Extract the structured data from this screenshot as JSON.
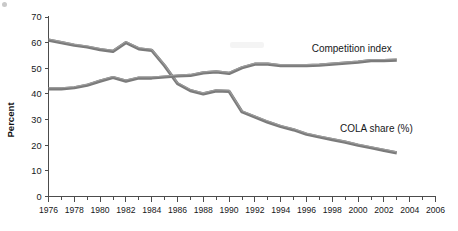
{
  "chart_data": {
    "type": "line",
    "title": "",
    "xlabel": "",
    "ylabel": "Percent",
    "xlim": [
      1976,
      2006
    ],
    "ylim": [
      0,
      70
    ],
    "ytick_step": 10,
    "yticks": [
      0,
      10,
      20,
      30,
      40,
      50,
      60,
      70
    ],
    "xticks": [
      1976,
      1978,
      1980,
      1982,
      1984,
      1986,
      1988,
      1990,
      1992,
      1994,
      1996,
      1998,
      2000,
      2002,
      2004,
      2006
    ],
    "xtick_labels": [
      "1976",
      "1978",
      "1980",
      "1982",
      "1984",
      "1986",
      "1988",
      "1990",
      "1992",
      "1994",
      "1996",
      "1998",
      "2000",
      "2002",
      "2004",
      "2006"
    ],
    "ytick_labels": [
      "0",
      "10",
      "20",
      "30",
      "40",
      "50",
      "60",
      "70"
    ],
    "minor_xticks_every": 1,
    "grid": false,
    "legend_position": "inline-right-of-line",
    "line_color": "#7b7b7b",
    "axis_color": "#4c4c4c",
    "x": [
      1976,
      1977,
      1978,
      1979,
      1980,
      1981,
      1982,
      1983,
      1984,
      1985,
      1986,
      1987,
      1988,
      1989,
      1990,
      1991,
      1992,
      1993,
      1994,
      1995,
      1996,
      1997,
      1998,
      1999,
      2000,
      2001,
      2002,
      2003
    ],
    "series": [
      {
        "name": "COLA share (%)",
        "label": "COLA share (%)",
        "label_x": 1998.6,
        "label_y": 25.0,
        "values": [
          61.0,
          60.0,
          59.0,
          58.3,
          57.3,
          56.6,
          60.0,
          57.6,
          57.0,
          51.0,
          44.0,
          41.3,
          40.0,
          41.2,
          41.0,
          33.0,
          31.0,
          29.0,
          27.3,
          26.0,
          24.3,
          23.2,
          22.2,
          21.2,
          20.0,
          19.0,
          18.0,
          17.0
        ]
      },
      {
        "name": "Competition index",
        "label": "Competition index",
        "label_x": 1996.4,
        "label_y": 56.5,
        "values": [
          42.0,
          42.0,
          42.4,
          43.4,
          45.0,
          46.4,
          45.0,
          46.2,
          46.2,
          46.6,
          47.0,
          47.2,
          48.2,
          48.6,
          48.0,
          50.2,
          51.6,
          51.6,
          51.0,
          51.0,
          51.0,
          51.2,
          51.6,
          52.0,
          52.4,
          53.0,
          53.0,
          53.2
        ]
      }
    ]
  },
  "axis": {
    "y_title": "Percent"
  }
}
